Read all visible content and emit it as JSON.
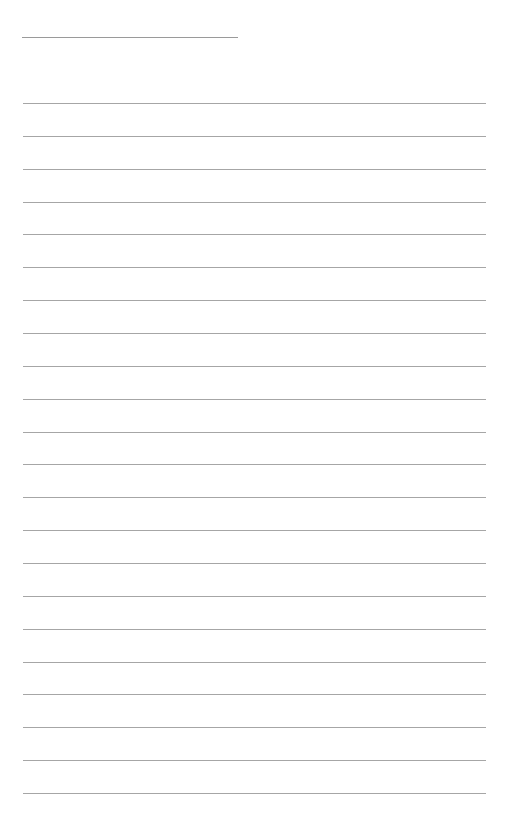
{
  "page": {
    "type": "lined-writing-sheet",
    "background": "#ffffff",
    "line_color": "#a6a6a6",
    "title_line": {
      "x": 22,
      "y": 37,
      "width": 216,
      "text": ""
    },
    "ruled_lines": {
      "count": 22,
      "first_y": 103,
      "spacing": 32.86,
      "x": 23,
      "width": 463
    }
  }
}
